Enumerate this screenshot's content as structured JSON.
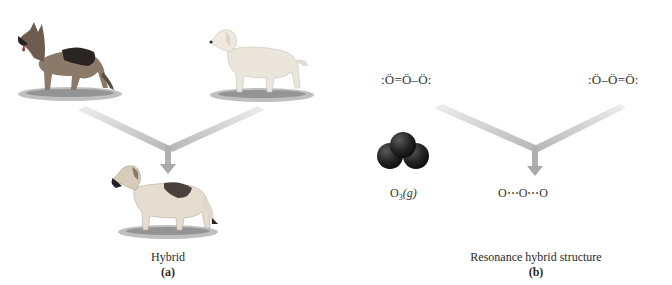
{
  "figure": {
    "panel_a": {
      "parent_left": "German shepherd dog",
      "parent_right": "Labrador retriever dog",
      "offspring": "Hybrid dog",
      "caption": "Hybrid",
      "letter": "(a)"
    },
    "panel_b": {
      "structure_left": ":Ö=Ö–Ö:",
      "structure_right": ":Ö–Ö=Ö:",
      "molecule_model_label_main": "O",
      "molecule_model_label_sub": "3",
      "molecule_model_label_state": "(g)",
      "hybrid_structure": "O⋯O⋯O",
      "caption": "Resonance hybrid structure",
      "letter": "(b)"
    },
    "colors": {
      "arrow": "#c9c9c9",
      "arrow_dark": "#a8a8a8",
      "sphere": "#1e1e1e",
      "grass": "#7a7a7a"
    }
  }
}
